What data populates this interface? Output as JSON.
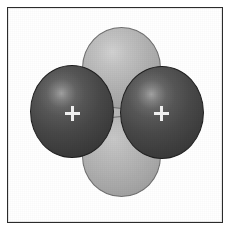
{
  "figure": {
    "background_color": "#ffffff",
    "frame": {
      "border_color": "#2b2b2b",
      "border_width_px": 1.5,
      "x": 7,
      "y": 7,
      "width": 216,
      "height": 216
    }
  },
  "chart_data": {
    "type": "diagram",
    "title": "Orbital overlap diagram",
    "shapes": [
      {
        "name": "upper-orbital-lobe",
        "role": "p-orbital upper lobe",
        "shape": "sphere",
        "fill": "#b2b2b2",
        "outline": "#6f6f6f",
        "center": [
          121,
          68
        ],
        "radius_x": 39,
        "radius_y": 41,
        "highlight": "#d2d2d2"
      },
      {
        "name": "lower-orbital-lobe",
        "role": "p-orbital lower lobe",
        "shape": "sphere",
        "fill": "#b0b0b0",
        "outline": "#6f6f6f",
        "center": [
          121,
          156
        ],
        "radius_x": 39,
        "radius_y": 40,
        "highlight": "#c8c8c8"
      },
      {
        "name": "left-atom-sphere",
        "role": "atomic nucleus sphere",
        "shape": "sphere",
        "fill": "#484848",
        "outline": "#1e1e1e",
        "center": [
          72,
          111
        ],
        "radius_x": 42,
        "radius_y": 46,
        "highlight": "#a0a0a0",
        "marker": "+"
      },
      {
        "name": "right-atom-sphere",
        "role": "atomic nucleus sphere",
        "shape": "sphere",
        "fill": "#494949",
        "outline": "#1e1e1e",
        "center": [
          162,
          112
        ],
        "radius_x": 42,
        "radius_y": 46,
        "highlight": "#a2a2a2",
        "marker": "+"
      }
    ],
    "markers": [
      {
        "name": "left-nucleus-marker",
        "label": "+",
        "color": "#f2f2f2",
        "position": [
          72,
          113
        ]
      },
      {
        "name": "right-nucleus-marker",
        "label": "+",
        "color": "#f2f2f2",
        "position": [
          161,
          113
        ]
      }
    ],
    "colors": {
      "atom_dark": "#484848",
      "atom_outline": "#1e1e1e",
      "orbital_light": "#b2b2b2",
      "orbital_outline": "#6f6f6f",
      "marker": "#f2f2f2",
      "frame": "#2b2b2b",
      "background": "#ffffff"
    }
  }
}
